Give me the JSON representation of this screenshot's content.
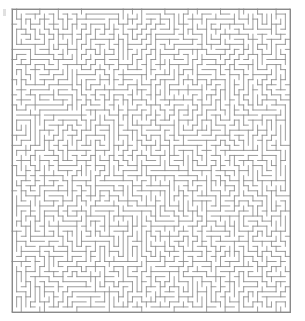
{
  "page": {
    "background_color": "#ffffff"
  },
  "maze": {
    "name": "square-grid-maze",
    "type": "perfect-maze",
    "cols": 60,
    "rows": 60,
    "cell_size_px": 4.63,
    "origin_x_px": 12,
    "origin_y_px": 9,
    "width_px": 278,
    "height_px": 303,
    "wall_color": "#8a8a8a",
    "border_color": "#8a8a8a",
    "wall_thickness_px": 0.85,
    "border_thickness_px": 1,
    "background_color": "#ffffff",
    "has_solid_border": true,
    "seed": 20240517,
    "labels": {
      "alt_text": "Dense square maze puzzle"
    }
  },
  "artifact": {
    "name": "left-edge-mark",
    "color": "#d8d8d8",
    "visible": true
  }
}
